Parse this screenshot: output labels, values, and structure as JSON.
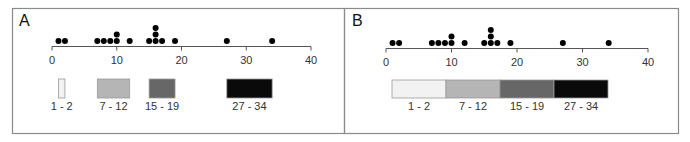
{
  "chart_data": [
    {
      "type": "scatter",
      "panel_label": "A",
      "title": "",
      "xlabel": "",
      "ylabel": "",
      "xlim": [
        0,
        40
      ],
      "xticks": [
        0,
        10,
        20,
        30,
        40
      ],
      "xtick_labels": [
        "0",
        "10",
        "20",
        "30",
        "40"
      ],
      "grid": false,
      "points": [
        1,
        2,
        7,
        8,
        9,
        10,
        10,
        12,
        15,
        16,
        16,
        16,
        17,
        19,
        27,
        34
      ],
      "legend_style": "proportional",
      "legend": [
        {
          "label": "1 - 2",
          "range": [
            1,
            2
          ],
          "color": "#f2f2f2"
        },
        {
          "label": "7 - 12",
          "range": [
            7,
            12
          ],
          "color": "#b5b5b5"
        },
        {
          "label": "15 - 19",
          "range": [
            15,
            19
          ],
          "color": "#676767"
        },
        {
          "label": "27 - 34",
          "range": [
            27,
            34
          ],
          "color": "#0a0a0a"
        }
      ]
    },
    {
      "type": "scatter",
      "panel_label": "B",
      "title": "",
      "xlabel": "",
      "ylabel": "",
      "xlim": [
        0,
        40
      ],
      "xticks": [
        0,
        10,
        20,
        30,
        40
      ],
      "xtick_labels": [
        "0",
        "10",
        "20",
        "30",
        "40"
      ],
      "grid": false,
      "points": [
        1,
        2,
        7,
        8,
        9,
        10,
        10,
        12,
        15,
        16,
        16,
        16,
        17,
        19,
        27,
        34
      ],
      "legend_style": "equal",
      "legend": [
        {
          "label": "1 - 2",
          "range": [
            1,
            2
          ],
          "color": "#f2f2f2"
        },
        {
          "label": "7 - 12",
          "range": [
            7,
            12
          ],
          "color": "#b5b5b5"
        },
        {
          "label": "15 - 19",
          "range": [
            15,
            19
          ],
          "color": "#676767"
        },
        {
          "label": "27 - 34",
          "range": [
            27,
            34
          ],
          "color": "#0a0a0a"
        }
      ]
    }
  ]
}
